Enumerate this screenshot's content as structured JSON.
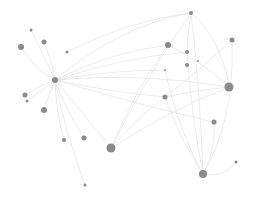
{
  "diagram": {
    "type": "network-graph",
    "width": 253,
    "height": 197,
    "colors": {
      "background": "#ffffff",
      "node": "#8a8a8a",
      "edge": "#e2e2e2"
    },
    "nodes": [
      {
        "id": "hub",
        "x": 55,
        "y": 80,
        "r": 3
      },
      {
        "id": "n1",
        "x": 21,
        "y": 47,
        "r": 3
      },
      {
        "id": "n2",
        "x": 31,
        "y": 30,
        "r": 1.5
      },
      {
        "id": "n3",
        "x": 44,
        "y": 42,
        "r": 2.5
      },
      {
        "id": "n4",
        "x": 67,
        "y": 52,
        "r": 1.5
      },
      {
        "id": "n5",
        "x": 25,
        "y": 95,
        "r": 2.5
      },
      {
        "id": "n6",
        "x": 27,
        "y": 101,
        "r": 1.5
      },
      {
        "id": "n7",
        "x": 44,
        "y": 110,
        "r": 3
      },
      {
        "id": "n8",
        "x": 64,
        "y": 140,
        "r": 2
      },
      {
        "id": "n9",
        "x": 84,
        "y": 138,
        "r": 2.5
      },
      {
        "id": "n10",
        "x": 85,
        "y": 185,
        "r": 1.5
      },
      {
        "id": "n11",
        "x": 111,
        "y": 148,
        "r": 4.5
      },
      {
        "id": "n12",
        "x": 191,
        "y": 13,
        "r": 2
      },
      {
        "id": "n13",
        "x": 168,
        "y": 45,
        "r": 3
      },
      {
        "id": "n14",
        "x": 187,
        "y": 52,
        "r": 2
      },
      {
        "id": "n15",
        "x": 198,
        "y": 61,
        "r": 1
      },
      {
        "id": "n16",
        "x": 187,
        "y": 65,
        "r": 2
      },
      {
        "id": "n17",
        "x": 232,
        "y": 40,
        "r": 2.5
      },
      {
        "id": "n18",
        "x": 165,
        "y": 70,
        "r": 1
      },
      {
        "id": "n19",
        "x": 229,
        "y": 87,
        "r": 4.5
      },
      {
        "id": "n20",
        "x": 165,
        "y": 97,
        "r": 2.5
      },
      {
        "id": "n21",
        "x": 214,
        "y": 122,
        "r": 2.5
      },
      {
        "id": "n22",
        "x": 236,
        "y": 162,
        "r": 1.5
      },
      {
        "id": "n23",
        "x": 203,
        "y": 174,
        "r": 4
      }
    ],
    "edges": [
      {
        "s": "hub",
        "t": "n1",
        "c": [
          35,
          70
        ]
      },
      {
        "s": "hub",
        "t": "n2",
        "c": [
          42,
          52
        ]
      },
      {
        "s": "hub",
        "t": "n3",
        "c": [
          52,
          60
        ]
      },
      {
        "s": "hub",
        "t": "n5",
        "c": [
          38,
          86
        ]
      },
      {
        "s": "hub",
        "t": "n6",
        "c": [
          40,
          92
        ]
      },
      {
        "s": "hub",
        "t": "n7",
        "c": [
          48,
          96
        ]
      },
      {
        "s": "hub",
        "t": "n8",
        "c": [
          56,
          112
        ]
      },
      {
        "s": "hub",
        "t": "n9",
        "c": [
          66,
          110
        ]
      },
      {
        "s": "hub",
        "t": "n10",
        "c": [
          66,
          135
        ]
      },
      {
        "s": "hub",
        "t": "n11",
        "c": [
          82,
          112
        ]
      },
      {
        "s": "hub",
        "t": "n12",
        "c": [
          120,
          25
        ]
      },
      {
        "s": "hub",
        "t": "n13",
        "c": [
          110,
          52
        ]
      },
      {
        "s": "hub",
        "t": "n14",
        "c": [
          120,
          58
        ]
      },
      {
        "s": "hub",
        "t": "n18",
        "c": [
          112,
          70
        ]
      },
      {
        "s": "hub",
        "t": "n19",
        "c": [
          140,
          72
        ]
      },
      {
        "s": "hub",
        "t": "n20",
        "c": [
          110,
          92
        ]
      },
      {
        "s": "hub",
        "t": "n21",
        "c": [
          140,
          105
        ]
      },
      {
        "s": "n4",
        "t": "n12",
        "c": [
          130,
          20
        ]
      },
      {
        "s": "n12",
        "t": "n11",
        "c": [
          150,
          70
        ]
      },
      {
        "s": "n12",
        "t": "n23",
        "c": [
          200,
          90
        ]
      },
      {
        "s": "n12",
        "t": "n19",
        "c": [
          222,
          40
        ]
      },
      {
        "s": "n12",
        "t": "n16",
        "c": [
          186,
          40
        ]
      },
      {
        "s": "n13",
        "t": "n19",
        "c": [
          200,
          60
        ]
      },
      {
        "s": "n13",
        "t": "n11",
        "c": [
          135,
          90
        ]
      },
      {
        "s": "n14",
        "t": "n23",
        "c": [
          192,
          120
        ]
      },
      {
        "s": "n17",
        "t": "n20",
        "c": [
          200,
          70
        ]
      },
      {
        "s": "n17",
        "t": "n23",
        "c": [
          235,
          120
        ]
      },
      {
        "s": "n19",
        "t": "n11",
        "c": [
          170,
          110
        ]
      },
      {
        "s": "n19",
        "t": "n20",
        "c": [
          195,
          90
        ]
      },
      {
        "s": "n20",
        "t": "n23",
        "c": [
          180,
          140
        ]
      },
      {
        "s": "n18",
        "t": "n23",
        "c": [
          178,
          130
        ]
      },
      {
        "s": "n21",
        "t": "n23",
        "c": [
          216,
          150
        ]
      },
      {
        "s": "n22",
        "t": "n23",
        "c": [
          225,
          178
        ]
      },
      {
        "s": "n11",
        "t": "n20",
        "c": [
          140,
          115
        ]
      }
    ]
  }
}
